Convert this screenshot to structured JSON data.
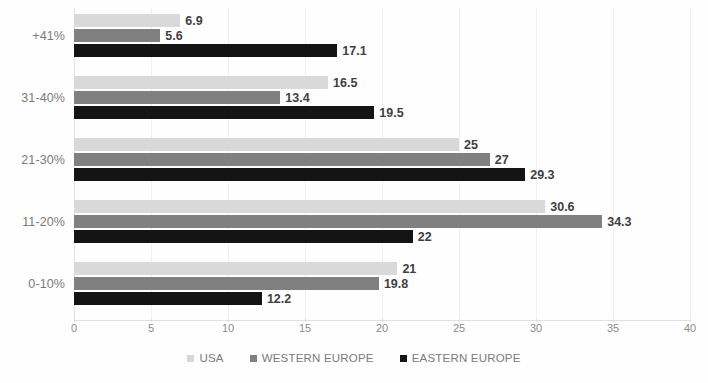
{
  "chart_data": {
    "type": "bar",
    "orientation": "horizontal",
    "title": "",
    "subtitle": "",
    "xlabel": "",
    "ylabel": "",
    "xlim": [
      0,
      40
    ],
    "xticks": [
      0,
      5,
      10,
      15,
      20,
      25,
      30,
      35,
      40
    ],
    "categories": [
      "+41%",
      "31-40%",
      "21-30%",
      "11-20%",
      "0-10%"
    ],
    "grid": true,
    "grid_axis": "x",
    "legend_position": "bottom",
    "series": [
      {
        "name": "USA",
        "color": "#d9d9d9",
        "values": [
          6.9,
          16.5,
          25,
          30.6,
          21
        ],
        "labels": [
          "6.9",
          "16.5",
          "25",
          "30.6",
          "21"
        ]
      },
      {
        "name": "WESTERN EUROPE",
        "color": "#808080",
        "values": [
          5.6,
          13.4,
          27,
          34.3,
          19.8
        ],
        "labels": [
          "5.6",
          "13.4",
          "27",
          "34.3",
          "19.8"
        ]
      },
      {
        "name": "EASTERN EUROPE",
        "color": "#141414",
        "values": [
          17.1,
          19.5,
          29.3,
          22,
          12.2
        ],
        "labels": [
          "17.1",
          "19.5",
          "29.3",
          "22",
          "12.2"
        ]
      }
    ]
  },
  "axis": {
    "tick_labels": [
      "0",
      "5",
      "10",
      "15",
      "20",
      "25",
      "30",
      "35",
      "40"
    ]
  },
  "categories": {
    "c0": "+41%",
    "c1": "31-40%",
    "c2": "21-30%",
    "c3": "11-20%",
    "c4": "0-10%"
  },
  "legend": {
    "items": [
      {
        "label": "USA",
        "color": "#d9d9d9"
      },
      {
        "label": "WESTERN EUROPE",
        "color": "#808080"
      },
      {
        "label": "EASTERN EUROPE",
        "color": "#141414"
      }
    ]
  },
  "values": {
    "g0": {
      "usa": "6.9",
      "west": "5.6",
      "east": "17.1"
    },
    "g1": {
      "usa": "16.5",
      "west": "13.4",
      "east": "19.5"
    },
    "g2": {
      "usa": "25",
      "west": "27",
      "east": "29.3"
    },
    "g3": {
      "usa": "30.6",
      "west": "34.3",
      "east": "22"
    },
    "g4": {
      "usa": "21",
      "west": "19.8",
      "east": "12.2"
    }
  }
}
